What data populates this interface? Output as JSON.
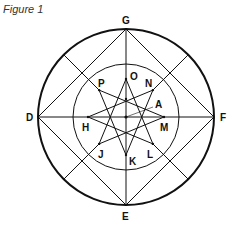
{
  "caption": "Figure 1",
  "diagram": {
    "center": [
      126,
      117
    ],
    "outer_radius": 88,
    "inner_radius": 53,
    "star_radius": 38,
    "outer_points": {
      "G": "top",
      "F": "right",
      "E": "bottom",
      "D": "left"
    },
    "star_points": [
      "O",
      "N",
      "M",
      "L",
      "K",
      "J",
      "H",
      "P"
    ],
    "center_label": "A",
    "labels": {
      "G": "G",
      "E": "E",
      "D": "D",
      "F": "F",
      "O": "O",
      "N": "N",
      "M": "M",
      "L": "L",
      "K": "K",
      "J": "J",
      "H": "H",
      "P": "P",
      "A": "A"
    },
    "star_type": "{8/3} star polygon"
  }
}
